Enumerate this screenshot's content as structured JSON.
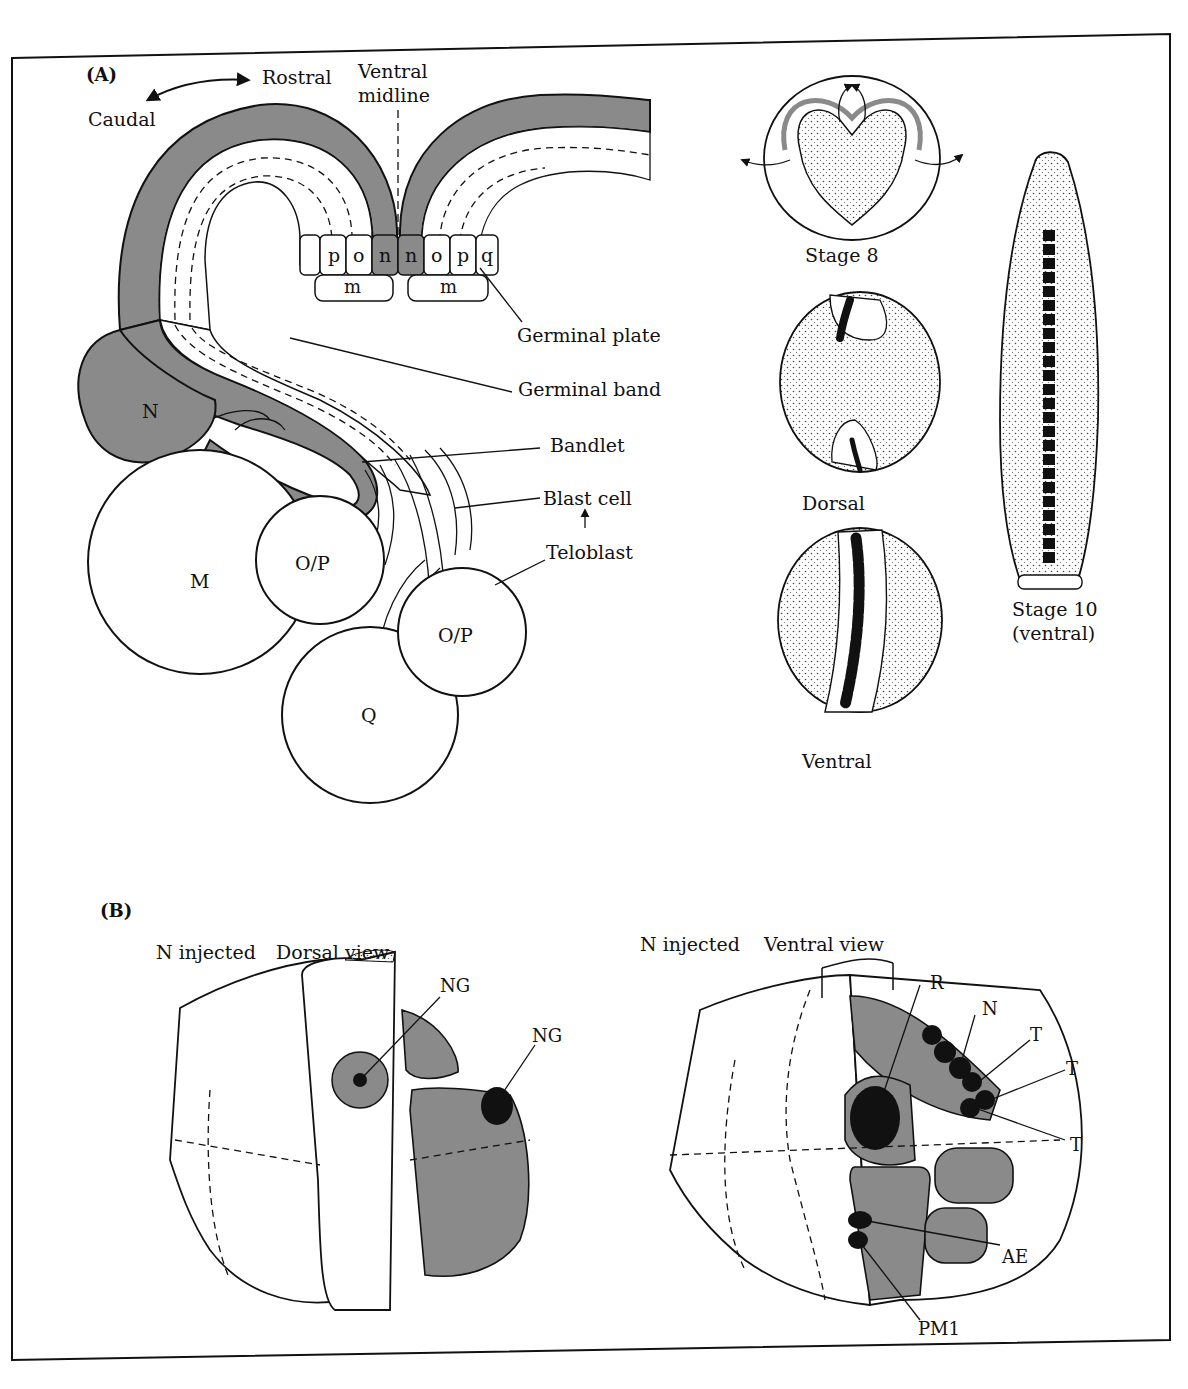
{
  "figure": {
    "panel_a": {
      "tag": "(A)",
      "orientation": {
        "caudal": "Caudal",
        "rostral": "Rostral"
      },
      "ventral_midline": [
        "Ventral",
        "midline"
      ],
      "plate_cells_top": [
        "p",
        "o",
        "n",
        "n",
        "o",
        "p",
        "q"
      ],
      "plate_cells_bottom": [
        "m",
        "m"
      ],
      "callouts": {
        "germinal_plate": "Germinal plate",
        "germinal_band": "Germinal band",
        "bandlet": "Bandlet",
        "blast_cell": "Blast cell",
        "teloblast": "Teloblast"
      },
      "teloblasts": {
        "n": "N",
        "m": "M",
        "op1": "O/P",
        "op2": "O/P",
        "q": "Q"
      },
      "stages": {
        "stage8": "Stage 8",
        "dorsal": "Dorsal",
        "ventral": "Ventral",
        "stage10": [
          "Stage 10",
          "(ventral)"
        ]
      }
    },
    "panel_b": {
      "tag": "(B)",
      "left": {
        "injected": "N injected",
        "view": "Dorsal view",
        "labels": [
          "NG",
          "NG"
        ]
      },
      "right": {
        "injected": "N injected",
        "view": "Ventral view",
        "labels": {
          "r": "R",
          "n": "N",
          "t1": "T",
          "t2": "T",
          "t3": "T",
          "ae": "AE",
          "pm1": "PM1"
        }
      }
    },
    "colors": {
      "shade": "#8a8a8a",
      "ink": "#111111",
      "paper": "#ffffff"
    }
  }
}
